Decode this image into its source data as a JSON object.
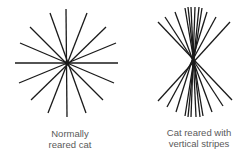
{
  "figures": [
    {
      "id": "normal",
      "caption_lines": [
        "Normally",
        "reared cat"
      ],
      "center": [
        67,
        63
      ],
      "stroke": "#1a1a1a",
      "lines": [
        [
          66,
          9,
          67,
          117
        ],
        [
          15,
          63,
          118,
          63
        ],
        [
          50,
          13,
          86,
          113
        ],
        [
          87,
          13,
          48,
          113
        ],
        [
          30,
          27,
          103,
          100
        ],
        [
          106,
          27,
          31,
          100
        ],
        [
          20,
          43,
          114,
          83
        ],
        [
          116,
          43,
          19,
          83
        ]
      ]
    },
    {
      "id": "stripes",
      "caption_lines": [
        "Cat reared with",
        "vertical stripes"
      ],
      "center": [
        194,
        62
      ],
      "stroke": "#1a1a1a",
      "lines": [
        [
          158,
          22,
          232,
          100
        ],
        [
          165,
          17,
          223,
          106
        ],
        [
          175,
          12,
          212,
          112
        ],
        [
          185,
          8,
          203,
          116
        ],
        [
          188,
          7,
          200,
          117
        ],
        [
          191,
          7,
          196,
          117
        ],
        [
          195,
          7,
          191,
          117
        ],
        [
          199,
          7,
          188,
          117
        ],
        [
          202,
          8,
          185,
          116
        ],
        [
          207,
          12,
          176,
          112
        ],
        [
          216,
          17,
          167,
          107
        ],
        [
          230,
          22,
          158,
          101
        ]
      ]
    }
  ]
}
